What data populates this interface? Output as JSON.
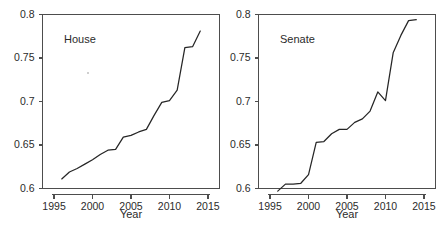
{
  "figure": {
    "background": "#ffffff",
    "line_color": "#262626",
    "axis_color": "#4d4d4d",
    "text_color": "#2b2b2b"
  },
  "chart_data": [
    {
      "type": "line",
      "title": "House",
      "xlabel": "Year",
      "ylabel": "",
      "xlim": [
        1993.5,
        2016.5
      ],
      "ylim": [
        0.6,
        0.8
      ],
      "grid": false,
      "legend": "none",
      "xticks": [
        1995,
        2000,
        2005,
        2010,
        2015
      ],
      "xticklabels": [
        "1995",
        "2000",
        "2005",
        "2010",
        "2015"
      ],
      "yticks": [
        0.6,
        0.65,
        0.7,
        0.75,
        0.8
      ],
      "yticklabels": [
        "0.6",
        "0.65",
        "0.7",
        "0.75",
        "0.8"
      ],
      "x": [
        1996,
        1997,
        1998,
        1999,
        2000,
        2001,
        2002,
        2003,
        2004,
        2005,
        2006,
        2007,
        2008,
        2009,
        2010,
        2011,
        2012,
        2013,
        2014
      ],
      "values": [
        0.611,
        0.619,
        0.623,
        0.628,
        0.633,
        0.639,
        0.644,
        0.645,
        0.659,
        0.661,
        0.665,
        0.668,
        0.684,
        0.699,
        0.701,
        0.713,
        0.762,
        0.763,
        0.781
      ]
    },
    {
      "type": "line",
      "title": "Senate",
      "xlabel": "Year",
      "ylabel": "",
      "xlim": [
        1993.5,
        2016.5
      ],
      "ylim": [
        0.6,
        0.8
      ],
      "grid": false,
      "legend": "none",
      "xticks": [
        1995,
        2000,
        2005,
        2010,
        2015
      ],
      "xticklabels": [
        "1995",
        "2000",
        "2005",
        "2010",
        "2015"
      ],
      "yticks": [
        0.6,
        0.65,
        0.7,
        0.75,
        0.8
      ],
      "yticklabels": [
        "0.6",
        "0.65",
        "0.7",
        "0.75",
        "0.8"
      ],
      "x": [
        1996,
        1997,
        1998,
        1999,
        2000,
        2001,
        2002,
        2003,
        2004,
        2005,
        2006,
        2007,
        2008,
        2009,
        2010,
        2011,
        2012,
        2013,
        2014
      ],
      "values": [
        0.597,
        0.605,
        0.605,
        0.606,
        0.616,
        0.653,
        0.654,
        0.663,
        0.668,
        0.668,
        0.676,
        0.68,
        0.689,
        0.711,
        0.701,
        0.756,
        0.776,
        0.793,
        0.794
      ]
    }
  ]
}
